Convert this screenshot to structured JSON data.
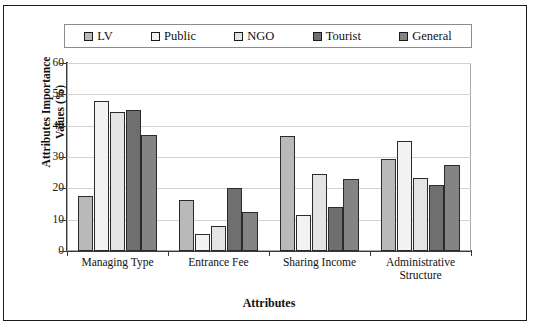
{
  "chart_data": {
    "type": "bar",
    "title": "",
    "xlabel": "Attributes",
    "ylabel": "Attributes Importance Values (%)",
    "ylabel_line1": "Attributes Importance",
    "ylabel_line2": "Values (%)",
    "ylim": [
      0,
      60
    ],
    "yticks": [
      0,
      10,
      20,
      30,
      40,
      50,
      60
    ],
    "grid": true,
    "legend_position": "top",
    "categories": [
      "Managing Type",
      "Entrance Fee",
      "Sharing Income",
      "Administrative Structure"
    ],
    "category_lines": [
      [
        "Managing Type"
      ],
      [
        "Entrance Fee"
      ],
      [
        "Sharing Income"
      ],
      [
        "Administrative",
        "Structure"
      ]
    ],
    "series": [
      {
        "name": "LV",
        "color": "#b9b9b9",
        "values": [
          17.5,
          16.3,
          36.7,
          29.5
        ]
      },
      {
        "name": "Public",
        "color": "#f2f2f2",
        "values": [
          48.0,
          5.3,
          11.5,
          35.0
        ]
      },
      {
        "name": "NGO",
        "color": "#e4e4e4",
        "values": [
          44.3,
          8.0,
          24.5,
          23.3
        ]
      },
      {
        "name": "Tourist",
        "color": "#6f6f6f",
        "values": [
          45.0,
          20.0,
          14.2,
          21.0
        ]
      },
      {
        "name": "General",
        "color": "#848484",
        "values": [
          37.0,
          12.5,
          23.0,
          27.5
        ]
      }
    ]
  }
}
